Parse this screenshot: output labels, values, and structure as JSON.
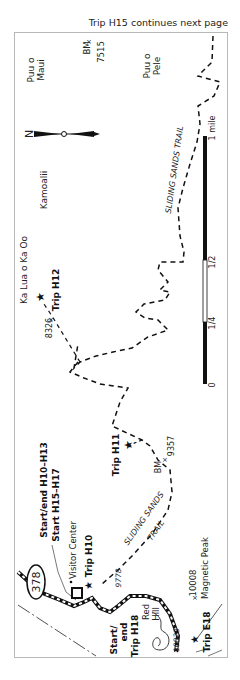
{
  "caption": "Trip H15 continues next page",
  "places": {
    "puu_o_maui": [
      "Puu o",
      "Maui"
    ],
    "bm_7515": [
      "BM",
      "7515"
    ],
    "puu_o_pele": [
      "Puu o",
      "Pele"
    ],
    "kamoalii": "Kamoalii",
    "ka_lua_o_ka_oo": "Ka Lua o Ka Oo",
    "elev_8326": "8326",
    "bm_9357": [
      "BM",
      "9357"
    ],
    "elev_9778": "9778",
    "elev_10023": "10023",
    "elev_10008": "10008",
    "magnetic_peak": "Magnetic Peak",
    "red_hill": [
      "Red",
      "Hill"
    ],
    "visitor_center": "Visitor Center"
  },
  "trail_labels": {
    "sliding_sands_upper": "SLIDING SANDS TRAIL",
    "sliding_sands_lower": [
      "SLIDING SANDS",
      "TRAIL"
    ]
  },
  "trips": {
    "h12": "Trip H12",
    "h11": "Trip H11",
    "h10": "Trip H10",
    "start_end_h10_h13": "Start/end H10–H13",
    "start_h15_h17": "Start H15–H17",
    "start_end_h18": [
      "Start/",
      "end",
      "Trip H18"
    ],
    "e18": "Trip E18"
  },
  "road": {
    "number": "378"
  },
  "compass": {
    "north": "N"
  },
  "scale": {
    "ticks": [
      "0",
      "1/4",
      "1/2",
      "1 mile"
    ]
  },
  "colors": {
    "ink": "#111111",
    "frame": "#b8b8b8",
    "road": "#222222"
  }
}
